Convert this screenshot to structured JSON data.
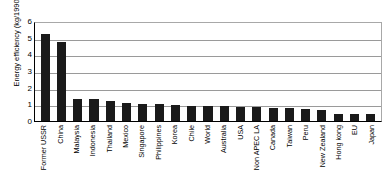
{
  "chart_data": {
    "type": "bar",
    "title": "",
    "xlabel": "",
    "ylabel": "Energy efficiency (kg/1990 US$)",
    "ylim": [
      0,
      6
    ],
    "yticks": [
      0,
      1,
      2,
      3,
      4,
      5,
      6
    ],
    "grid": true,
    "legend": false,
    "bar_color": "#1a1a1a",
    "categories": [
      "Former USSR",
      "China",
      "Malaysia",
      "Indonesia",
      "Thailand",
      "Mexico",
      "Singapore",
      "Philippines",
      "Korea",
      "Chile",
      "World",
      "Australia",
      "USA",
      "Non APEC LA",
      "Canada",
      "Taiwan",
      "Peru",
      "New Zealand",
      "Hong kong",
      "EU",
      "Japan"
    ],
    "values": [
      5.2,
      4.75,
      1.35,
      1.3,
      1.2,
      1.1,
      1.05,
      1.0,
      0.95,
      0.92,
      0.9,
      0.88,
      0.85,
      0.82,
      0.8,
      0.78,
      0.7,
      0.65,
      0.45,
      0.45,
      0.4
    ]
  }
}
